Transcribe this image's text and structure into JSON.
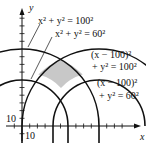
{
  "diagram": {
    "axes": {
      "x_label": "x",
      "y_label": "y",
      "tick_step": 10,
      "x_tick_label": "10",
      "y_tick_label": "10"
    },
    "shade_color": "#c8c8c8",
    "curves": [
      {
        "id": "c1",
        "equation_line1": "x² + y² = 100²",
        "center": [
          0,
          0
        ],
        "radius": 100
      },
      {
        "id": "c2",
        "equation_line1": "x² + y² = 60²",
        "center": [
          0,
          0
        ],
        "radius": 60
      },
      {
        "id": "c3",
        "equation_line1": "(x − 100)²",
        "equation_line2": "+ y² = 100²",
        "center": [
          100,
          0
        ],
        "radius": 100
      },
      {
        "id": "c4",
        "equation_line1": "(x − 100)²",
        "equation_line2": "+ y² = 60²",
        "center": [
          100,
          0
        ],
        "radius": 60
      }
    ]
  }
}
